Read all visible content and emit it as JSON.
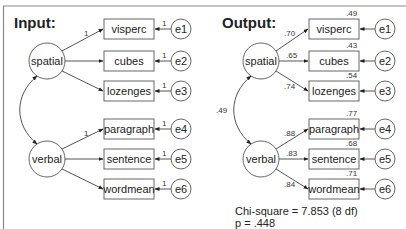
{
  "header": {
    "caption": ""
  },
  "input_panel": {
    "title": "Input:",
    "latents": [
      {
        "name": "spatial"
      },
      {
        "name": "verbal"
      }
    ],
    "observed": [
      {
        "name": "visperc",
        "error": "e1",
        "loading": "1",
        "error_weight": "1"
      },
      {
        "name": "cubes",
        "error": "e2",
        "loading": "",
        "error_weight": "1"
      },
      {
        "name": "lozenges",
        "error": "e3",
        "loading": "",
        "error_weight": "1"
      },
      {
        "name": "paragraph",
        "error": "e4",
        "loading": "1",
        "error_weight": "1"
      },
      {
        "name": "sentence",
        "error": "e5",
        "loading": "",
        "error_weight": "1"
      },
      {
        "name": "wordmean",
        "error": "e6",
        "loading": "",
        "error_weight": "1"
      }
    ],
    "covariance": ""
  },
  "output_panel": {
    "title": "Output:",
    "latents": [
      {
        "name": "spatial"
      },
      {
        "name": "verbal"
      }
    ],
    "observed": [
      {
        "name": "visperc",
        "error": "e1",
        "loading": ".70",
        "r2": ".49"
      },
      {
        "name": "cubes",
        "error": "e2",
        "loading": ".65",
        "r2": ".43"
      },
      {
        "name": "lozenges",
        "error": "e3",
        "loading": ".74",
        "r2": ".54"
      },
      {
        "name": "paragraph",
        "error": "e4",
        "loading": ".88",
        "r2": ".77"
      },
      {
        "name": "sentence",
        "error": "e5",
        "loading": ".83",
        "r2": ".68"
      },
      {
        "name": "wordmean",
        "error": "e6",
        "loading": ".84",
        "r2": ".71"
      }
    ],
    "covariance": ".49",
    "fit": {
      "chi_square": "Chi-square = 7.853 (8 df)",
      "p_value": "p = .448"
    }
  }
}
